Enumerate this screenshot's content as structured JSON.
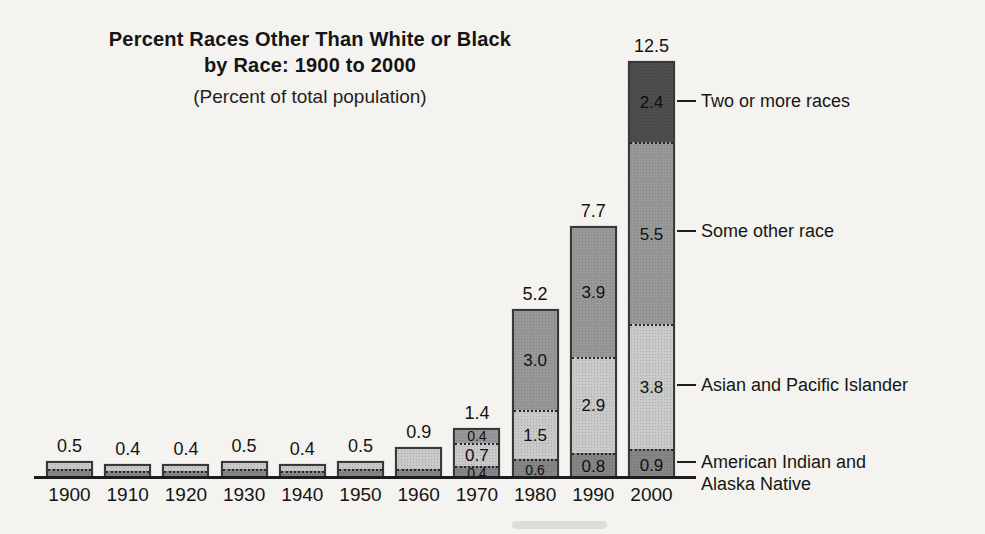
{
  "title": {
    "line1": "Percent Races Other Than White or Black",
    "line2": "by Race: 1900 to 2000",
    "subtitle": "(Percent of total population)"
  },
  "colors": {
    "american_indian_alaska_native": "#858585",
    "asian_pacific_islander": "#c9c9c9",
    "some_other_race": "#989898",
    "two_or_more_races": "#4d4d4d"
  },
  "chart_data": {
    "type": "bar",
    "stacked": true,
    "title": "Percent Races Other Than White or Black by Race: 1900 to 2000",
    "subtitle": "(Percent of total population)",
    "xlabel": "",
    "ylabel": "Percent of total population",
    "grid": false,
    "legend_position": "right-callouts",
    "categories": [
      "1900",
      "1910",
      "1920",
      "1930",
      "1940",
      "1950",
      "1960",
      "1970",
      "1980",
      "1990",
      "2000"
    ],
    "totals": [
      "0.5",
      "0.4",
      "0.4",
      "0.5",
      "0.4",
      "0.5",
      "0.9",
      "1.4",
      "5.2",
      "7.7",
      "12.5"
    ],
    "series": [
      {
        "name": "American Indian and Alaska Native",
        "key": "american_indian_alaska_native",
        "values": [
          0.3,
          0.25,
          0.25,
          0.3,
          0.25,
          0.3,
          0.3,
          0.4,
          0.6,
          0.8,
          0.9
        ],
        "labels": [
          null,
          null,
          null,
          null,
          null,
          null,
          null,
          "0.4",
          "0.6",
          "0.8",
          "0.9"
        ]
      },
      {
        "name": "Asian and Pacific Islander",
        "key": "asian_pacific_islander",
        "values": [
          0.2,
          0.15,
          0.15,
          0.2,
          0.15,
          0.2,
          0.6,
          0.7,
          1.5,
          2.9,
          3.8
        ],
        "labels": [
          null,
          null,
          null,
          null,
          null,
          null,
          null,
          "0.7",
          "1.5",
          "2.9",
          "3.8"
        ]
      },
      {
        "name": "Some other race",
        "key": "some_other_race",
        "values": [
          0,
          0,
          0,
          0,
          0,
          0,
          0,
          0.4,
          3.0,
          3.9,
          5.5
        ],
        "labels": [
          null,
          null,
          null,
          null,
          null,
          null,
          null,
          "0.4",
          "3.0",
          "3.9",
          "5.5"
        ]
      },
      {
        "name": "Two or more races",
        "key": "two_or_more_races",
        "values": [
          0,
          0,
          0,
          0,
          0,
          0,
          0,
          0,
          0,
          0,
          2.4
        ],
        "labels": [
          null,
          null,
          null,
          null,
          null,
          null,
          null,
          null,
          null,
          null,
          "2.4"
        ]
      }
    ]
  },
  "callouts": [
    {
      "text": "Two or more races",
      "series": "two_or_more_races",
      "wrap": false
    },
    {
      "text": "Some other race",
      "series": "some_other_race",
      "wrap": false
    },
    {
      "text": "Asian and Pacific Islander",
      "series": "asian_pacific_islander",
      "wrap": false
    },
    {
      "text": "American Indian and Alaska Native",
      "series": "american_indian_alaska_native",
      "wrap": true
    }
  ]
}
